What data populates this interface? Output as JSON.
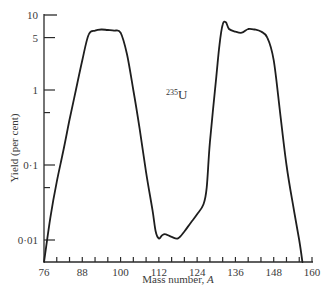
{
  "chart_data": {
    "type": "line",
    "title": "",
    "xlabel": "Mass number, A",
    "ylabel": "Yield (per cent)",
    "xscale": "linear",
    "yscale": "log",
    "xlim": [
      76,
      160
    ],
    "ylim": [
      0.005,
      10
    ],
    "ylim_note": "Lower bound ~0.005 is extrapolated from pixel spacing (75px/decade); the axis floor is not a labeled value.",
    "x_ticks": [
      76,
      88,
      100,
      112,
      124,
      136,
      148,
      160
    ],
    "x_tick_labels": [
      "76",
      "88",
      "100",
      "112",
      "124",
      "136",
      "148",
      "160"
    ],
    "x_minor_tick_interval": 4,
    "y_ticks": [
      10,
      5,
      1,
      0.1,
      0.01
    ],
    "y_tick_labels": [
      "10",
      "5",
      "1",
      "0·1",
      "0·01"
    ],
    "y_minor_ticks": [
      0.5,
      0.05
    ],
    "grid": false,
    "legend": null,
    "annotations": [
      {
        "text": "235U",
        "superscript": "235",
        "base": "U",
        "x": 117,
        "y": 0.7
      }
    ],
    "series": [
      {
        "name": "235U fission yield",
        "points_note": "Interior points read off the curve. Endpoints at A=76 and A~157 are where the curve meets the axis floor; their y values reflect the plot range, not a measured yield.",
        "x": [
          76,
          78,
          80,
          82,
          84,
          86,
          88,
          90,
          92,
          94,
          96,
          98,
          100,
          102,
          104,
          106,
          108,
          110,
          111,
          112,
          113,
          114,
          116,
          118,
          120,
          122,
          124,
          126,
          127,
          128,
          130,
          131,
          132,
          133,
          134,
          136,
          138,
          140,
          142,
          144,
          146,
          148,
          150,
          152,
          154,
          156,
          157
        ],
        "y": [
          0.005,
          0.02,
          0.06,
          0.15,
          0.4,
          1.0,
          2.5,
          5.5,
          6.2,
          6.4,
          6.3,
          6.2,
          5.8,
          3.0,
          1.0,
          0.3,
          0.08,
          0.025,
          0.013,
          0.0105,
          0.0115,
          0.012,
          0.011,
          0.0105,
          0.013,
          0.017,
          0.022,
          0.03,
          0.05,
          0.2,
          1.5,
          4.0,
          7.5,
          8.0,
          6.5,
          6.0,
          5.8,
          6.5,
          6.4,
          6.0,
          5.0,
          2.5,
          0.5,
          0.1,
          0.03,
          0.01,
          0.005
        ]
      }
    ]
  }
}
